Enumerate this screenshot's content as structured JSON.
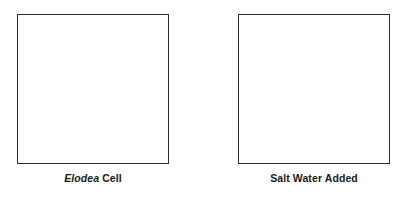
{
  "figure": {
    "background_color": "#ffffff",
    "border_color": "#2b2b2b",
    "text_color": "#1a1a1a"
  },
  "panels": [
    {
      "id": "elodea-cell",
      "box_label": "",
      "caption_species": "Elodea",
      "caption_rest": " Cell",
      "caption_full": "Elodea Cell"
    },
    {
      "id": "salt-water-added",
      "box_label": "",
      "caption_species": "",
      "caption_rest": "Salt Water Added",
      "caption_full": "Salt Water Added"
    }
  ]
}
